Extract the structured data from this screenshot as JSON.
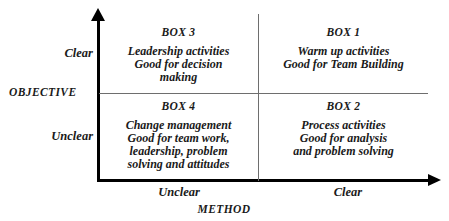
{
  "figure": {
    "name": "objective-method-matrix",
    "background_color": "#ffffff",
    "axis_color": "#000000",
    "divider_color": "#6e6e6e"
  },
  "axes": {
    "vertical": {
      "title": "OBJECTIVE",
      "high_label": "Clear",
      "low_label": "Unclear",
      "arrow": "up-arrow-icon"
    },
    "horizontal": {
      "title": "METHOD",
      "low_label": "Unclear",
      "high_label": "Clear",
      "arrow": "right-arrow-icon"
    }
  },
  "quadrants": [
    {
      "id": "box3",
      "title": "BOX 3",
      "position": "top-left",
      "objective": "Clear",
      "method": "Unclear",
      "lines": [
        "Leadership activities",
        "Good for decision",
        "making"
      ]
    },
    {
      "id": "box1",
      "title": "BOX 1",
      "position": "top-right",
      "objective": "Clear",
      "method": "Clear",
      "lines": [
        "Warm up activities",
        "Good for Team Building"
      ]
    },
    {
      "id": "box4",
      "title": "BOX 4",
      "position": "bottom-left",
      "objective": "Unclear",
      "method": "Unclear",
      "lines": [
        "Change management",
        "Good for team work,",
        "leadership, problem",
        "solving and attitudes"
      ]
    },
    {
      "id": "box2",
      "title": "BOX 2",
      "position": "bottom-right",
      "objective": "Unclear",
      "method": "Clear",
      "lines": [
        "Process activities",
        "Good for analysis",
        "and problem solving"
      ]
    }
  ],
  "chart_data": {
    "type": "table",
    "title": "",
    "xlabel": "METHOD",
    "ylabel": "OBJECTIVE",
    "x_tick_labels": [
      "Unclear",
      "Clear"
    ],
    "y_tick_labels": [
      "Unclear",
      "Clear"
    ],
    "grid": true,
    "legend": "none",
    "categories": [
      "BOX 3",
      "BOX 1",
      "BOX 4",
      "BOX 2"
    ],
    "cells": [
      {
        "label": "BOX 3",
        "x": "Unclear",
        "y": "Clear",
        "text": "Leadership activities Good for decision making"
      },
      {
        "label": "BOX 1",
        "x": "Clear",
        "y": "Clear",
        "text": "Warm up activities Good for Team Building"
      },
      {
        "label": "BOX 4",
        "x": "Unclear",
        "y": "Unclear",
        "text": "Change management Good for team work, leadership, problem solving and attitudes"
      },
      {
        "label": "BOX 2",
        "x": "Clear",
        "y": "Unclear",
        "text": "Process activities Good for analysis and problem solving"
      }
    ]
  }
}
